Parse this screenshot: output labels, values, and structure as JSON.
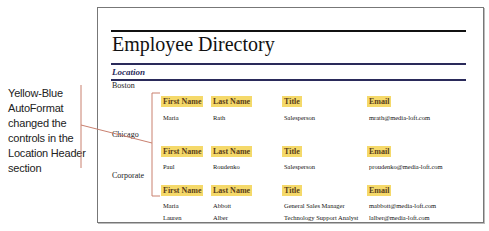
{
  "callout": {
    "text": "Yellow-Blue AutoFormat changed the controls in the Location Header section"
  },
  "report": {
    "title": "Employee Directory",
    "group_header_label": "Location",
    "colors": {
      "header_fill": "#f5d96a",
      "header_text": "#5a3e1a",
      "navy_rule": "#2a2a5a",
      "callout_line": "#c9806f"
    },
    "column_headers": [
      "First Name",
      "Last Name",
      "Title",
      "Email"
    ],
    "groups": [
      {
        "location": "Boston",
        "rows": [
          [
            "Maria",
            "Rath",
            "Salesperson",
            "mrath@media-loft.com"
          ]
        ]
      },
      {
        "location": "Chicago",
        "rows": [
          [
            "Paul",
            "Roudenko",
            "Salesperson",
            "proudenko@media-loft.com"
          ]
        ]
      },
      {
        "location": "Corporate",
        "rows": [
          [
            "Maria",
            "Abbott",
            "General Sales Manager",
            "mabbott@media-loft.com"
          ],
          [
            "Lauren",
            "Alber",
            "Technology Support Analyst",
            "lalber@media-loft.com"
          ]
        ]
      }
    ]
  }
}
